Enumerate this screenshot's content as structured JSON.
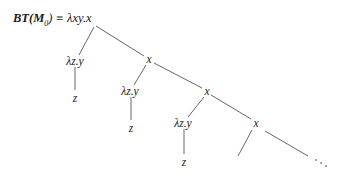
{
  "diagram": {
    "root": {
      "label_bt": "BT(",
      "label_m": "M",
      "label_sub": "0",
      "label_rest": ") ≡ λxy.x"
    },
    "nodes": [
      {
        "id": "lam1",
        "label": "λz.y"
      },
      {
        "id": "z1",
        "label": "z"
      },
      {
        "id": "x1",
        "label": "x"
      },
      {
        "id": "lam2",
        "label": "λz.y"
      },
      {
        "id": "z2",
        "label": "z"
      },
      {
        "id": "x2",
        "label": "x"
      },
      {
        "id": "lam3",
        "label": "λz.y"
      },
      {
        "id": "z3",
        "label": "z"
      },
      {
        "id": "x3",
        "label": "x"
      }
    ],
    "ellipsis": "…",
    "edges": [
      [
        "root",
        "lam1"
      ],
      [
        "root",
        "x1"
      ],
      [
        "lam1",
        "z1"
      ],
      [
        "x1",
        "lam2"
      ],
      [
        "x1",
        "x2"
      ],
      [
        "lam2",
        "z2"
      ],
      [
        "x2",
        "lam3"
      ],
      [
        "x2",
        "x3"
      ],
      [
        "lam3",
        "z3"
      ],
      [
        "x3",
        "(left-subtree)"
      ],
      [
        "x3",
        "…"
      ]
    ]
  }
}
